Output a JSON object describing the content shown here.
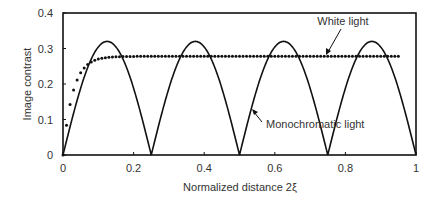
{
  "chart_data": {
    "type": "line",
    "title": "",
    "xlabel": "Normalized distance 2ξ",
    "ylabel": "Image contrast",
    "xlim": [
      0,
      1
    ],
    "ylim": [
      0,
      0.4
    ],
    "x_ticks": [
      0,
      0.2,
      0.4,
      0.6,
      0.8,
      1
    ],
    "x_tick_labels": [
      "0",
      "0.2",
      "0.4",
      "0.6",
      "0.8",
      "1"
    ],
    "y_ticks": [
      0,
      0.1,
      0.2,
      0.3,
      0.4
    ],
    "y_tick_labels": [
      "0",
      "0.1",
      "0.2",
      "0.3",
      "0.4"
    ],
    "grid": false,
    "legend": "none (inline annotations)",
    "series": [
      {
        "name": "Monochromatic light",
        "style": "solid",
        "color": "#111111",
        "x": [
          0,
          0.0625,
          0.125,
          0.1875,
          0.25,
          0.3125,
          0.375,
          0.4375,
          0.5,
          0.5625,
          0.625,
          0.6875,
          0.75,
          0.8125,
          0.875,
          0.9375,
          1
        ],
        "y": [
          0,
          0.226,
          0.32,
          0.226,
          0,
          0.226,
          0.32,
          0.226,
          0,
          0.226,
          0.32,
          0.226,
          0,
          0.226,
          0.32,
          0.226,
          0
        ]
      },
      {
        "name": "White light",
        "style": "dotted",
        "color": "#111111",
        "x": [
          0,
          0.02,
          0.04,
          0.06,
          0.08,
          0.1,
          0.12,
          0.2,
          0.4,
          0.6,
          0.8,
          0.95
        ],
        "y": [
          0,
          0.11,
          0.19,
          0.24,
          0.265,
          0.275,
          0.278,
          0.278,
          0.278,
          0.278,
          0.278,
          0.278
        ]
      }
    ],
    "annotations": [
      {
        "text": "White light",
        "arrow_to": [
          0.68,
          0.278
        ]
      },
      {
        "text": "Monochromatic light",
        "arrow_to": [
          0.34,
          0.245
        ]
      }
    ]
  }
}
